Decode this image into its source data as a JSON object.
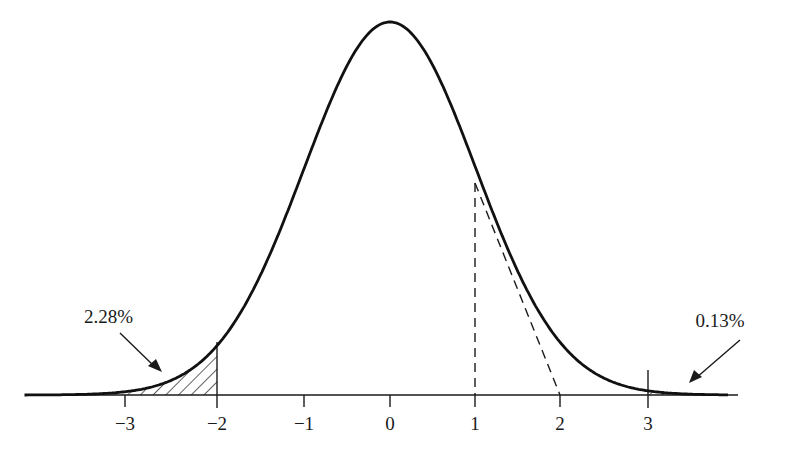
{
  "chart_data": {
    "type": "line",
    "title": "",
    "xlabel": "",
    "ylabel": "",
    "xlim": [
      -4.2,
      4.0
    ],
    "grid": false,
    "x_ticks": [
      -3,
      -2,
      -1,
      0,
      1,
      2,
      3
    ],
    "x_tick_labels": [
      "−3",
      "−2",
      "−1",
      "0",
      "1",
      "2",
      "3"
    ],
    "series": [
      {
        "name": "normal-density",
        "style": "solid",
        "mean": 0,
        "sd": 1
      }
    ],
    "shaded_regions": [
      {
        "from": "-inf",
        "to": -2,
        "label": "2.28%",
        "pattern": "hatched"
      },
      {
        "from": 3,
        "to": "inf",
        "label": "0.13%",
        "pattern": "hatched"
      }
    ],
    "reference_lines": [
      {
        "type": "vertical-dashed",
        "x": 1,
        "note": "inflection point"
      },
      {
        "type": "tangent-dashed",
        "from_x": 1,
        "to_x": 2,
        "note": "tangent at inflection point meets axis at 2"
      },
      {
        "type": "vertical-solid",
        "x": -2
      },
      {
        "type": "vertical-solid",
        "x": 3
      }
    ],
    "annotations": [
      {
        "text": "2.28%",
        "points_to": "left tail area below -2"
      },
      {
        "text": "0.13%",
        "points_to": "right tail area above 3"
      }
    ]
  },
  "labels": {
    "ticks": [
      "−3",
      "−2",
      "−1",
      "0",
      "1",
      "2",
      "3"
    ],
    "left_tail": "2.28%",
    "right_tail": "0.13%"
  }
}
